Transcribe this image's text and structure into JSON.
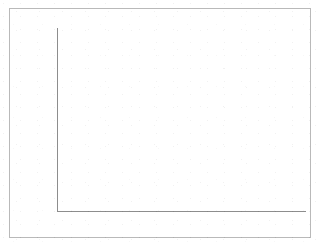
{
  "figure": {
    "unit_label": "[%]",
    "frame_color": "#b9b9b9",
    "axis_color": "#8d8d8d",
    "bar_fill_color": "#EFD6A8",
    "bar_border_color": "#9E7B48",
    "text_color": "#3A3A3A",
    "background_color": "#FFFFFF"
  },
  "chart_data": {
    "type": "bar",
    "title": "",
    "subtitle": "",
    "xlabel": "",
    "ylabel": "[%]",
    "categories": [
      "1993",
      "1996",
      "1997",
      "1998",
      "1999",
      "2000"
    ],
    "values": [
      18,
      26,
      36,
      60,
      78.5,
      68.5
    ],
    "ylim": [
      0,
      80
    ],
    "ytick_labels": [
      "0",
      "10",
      "20",
      "30",
      "40",
      "50",
      "60",
      "70",
      "80"
    ],
    "ytick_values": [
      0,
      10,
      20,
      30,
      40,
      50,
      60,
      70,
      80
    ],
    "xtick_labels": [
      "1993",
      "1996",
      "1997",
      "1998",
      "1999",
      "2000"
    ],
    "grid": false,
    "legend": null,
    "legend_position": "none",
    "annotations": []
  },
  "layout": {
    "y_axis_top_px": 29,
    "y_axis_baseline_px": 211,
    "plot_left_px": 57,
    "plot_right_px": 306,
    "bar_width_px": 22,
    "bar_slots_px": [
      66,
      132,
      166,
      200,
      234,
      268
    ]
  }
}
